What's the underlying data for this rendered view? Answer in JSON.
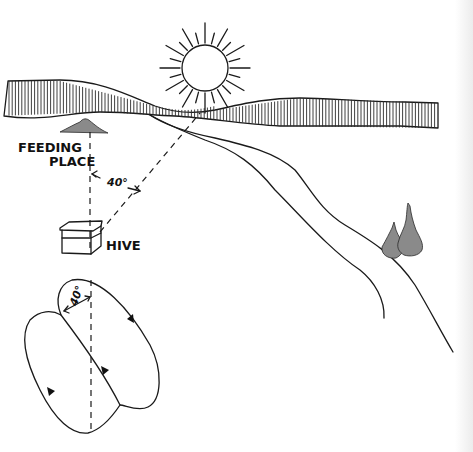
{
  "figure": {
    "labels": {
      "feeding_place_line1": "FEEDING",
      "feeding_place_line2": "PLACE",
      "hive": "HIVE",
      "angle_ground": "40°",
      "angle_dance": "40°"
    },
    "angle_degrees": 40,
    "dance_arrows": 4,
    "colors": {
      "ink": "#1a1a1a",
      "paper": "#ffffff",
      "stipple": "#8a8a8a"
    },
    "elements": [
      "sun",
      "horizon-hills",
      "road",
      "trees",
      "feeding-place",
      "hive",
      "waggle-dance-figure"
    ],
    "caption_cropped": true
  }
}
